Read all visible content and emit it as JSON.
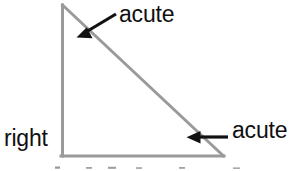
{
  "diagram": {
    "colors": {
      "triangle_stroke": "#9a9a9a",
      "arrow_stroke": "#121212",
      "text": "#101010",
      "background": "#ffffff"
    },
    "triangle": {
      "apex": {
        "x": 62,
        "y": 5
      },
      "bottom_left": {
        "x": 62,
        "y": 156
      },
      "bottom_right": {
        "x": 223,
        "y": 156
      },
      "stroke_width": 3
    },
    "labels": {
      "acute_top": "acute",
      "acute_right": "acute",
      "right": "right"
    },
    "arrows": [
      {
        "name": "acute-top-arrow",
        "tail": {
          "x": 116,
          "y": 14
        },
        "tip": {
          "x": 77,
          "y": 37
        }
      },
      {
        "name": "acute-right-arrow",
        "tail": {
          "x": 227,
          "y": 137
        },
        "tip": {
          "x": 187,
          "y": 137
        }
      }
    ],
    "cropped_text_marks": [
      {
        "x": 56,
        "y": 166
      },
      {
        "x": 87,
        "y": 166
      },
      {
        "x": 110,
        "y": 166
      },
      {
        "x": 137,
        "y": 166
      },
      {
        "x": 180,
        "y": 166
      },
      {
        "x": 235,
        "y": 166
      }
    ]
  }
}
